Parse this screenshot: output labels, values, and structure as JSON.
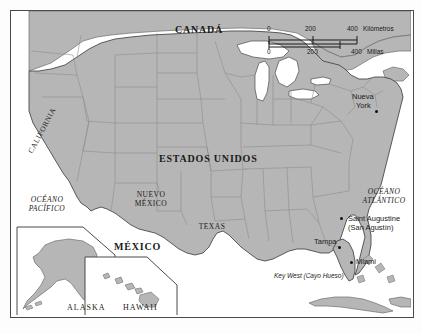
{
  "map": {
    "title_country_main": "ESTADOS UNIDOS",
    "countries": [
      {
        "name": "CANADÁ",
        "x": 196,
        "y": 22
      },
      {
        "name": "ESTADOS UNIDOS",
        "x": 187,
        "y": 150
      },
      {
        "name": "MÉXICO",
        "x": 128,
        "y": 240
      }
    ],
    "states": [
      {
        "name": "CALIFORNIA",
        "x": 47,
        "y": 152,
        "rotation": -62
      },
      {
        "name": "NUEVO MÉXICO",
        "line1": "NUEVO",
        "line2": "MÉXICO",
        "x": 138,
        "y": 192
      },
      {
        "name": "TEXAS",
        "x": 201,
        "y": 217
      }
    ],
    "oceans": [
      {
        "line1": "OCÉANO",
        "line2": "PACÍFICO",
        "x": 38,
        "y": 193
      },
      {
        "line1": "OCÉANO",
        "line2": "ATLÁNTICO",
        "x": 378,
        "y": 185
      }
    ],
    "cities": [
      {
        "name": "Nueva York",
        "line1": "Nueva",
        "line2": "York",
        "label_x": 358,
        "label_y": 88,
        "dot_x": 372,
        "dot_y": 106
      },
      {
        "name": "Saint Augustine (San Agustín)",
        "line1": "Saint Augustine",
        "line2": "(San Agustín)",
        "label_x": 340,
        "label_y": 215,
        "dot_x": 336,
        "dot_y": 213
      },
      {
        "name": "Tampa",
        "line1": "Tampa",
        "line2": "",
        "label_x": 313,
        "label_y": 236,
        "dot_x": 332,
        "dot_y": 243
      },
      {
        "name": "Miami",
        "line1": "Miami",
        "line2": "",
        "label_x": 352,
        "label_y": 255,
        "dot_x": 348,
        "dot_y": 257
      },
      {
        "name": "Key West (Cayo Hueso)",
        "line1": "Key West (Cayo Hueso)",
        "line2": "",
        "label_x": 272,
        "label_y": 270,
        "dot_x": 0,
        "dot_y": 0
      }
    ],
    "insets": [
      {
        "name": "ALASKA",
        "label": "ALASKA",
        "label_x": 78,
        "label_y": 305
      },
      {
        "name": "HAWAII",
        "label": "HAWAII",
        "label_x": 137,
        "label_y": 305
      }
    ],
    "scale_bar": {
      "top_unit": "Kilómetros",
      "bottom_unit": "Millas",
      "top_ticks": [
        "0",
        "200",
        "400"
      ],
      "bottom_ticks": [
        "0",
        "200",
        "400"
      ],
      "top_label": "0    200   400 Kilómetros",
      "bottom_label": "0       200        400 Millas"
    },
    "colors": {
      "land": "#b6b6b6",
      "land_stroke": "#6d6d6d",
      "water": "#ffffff",
      "frame": "#4a4a4a",
      "text": "#1a1a1a",
      "background": "#ffffff"
    }
  }
}
